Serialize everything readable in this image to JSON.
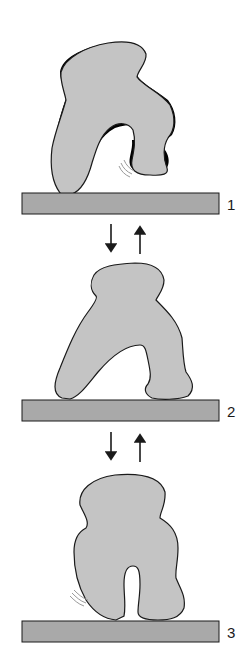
{
  "diagram": {
    "colors": {
      "shape_fill": "#c4c4c4",
      "shape_stroke": "#1a1a1a",
      "bar_fill": "#a9a9a9",
      "bar_stroke": "#1a1a1a",
      "motion_lines": "#9a9a9a",
      "arrow": "#1a1a1a"
    },
    "stages": [
      {
        "label": "1",
        "contacts": 1
      },
      {
        "label": "2",
        "contacts": 2
      },
      {
        "label": "3",
        "contacts": 2
      }
    ],
    "transitions": [
      {
        "from": "1",
        "to": "2",
        "arrows": [
          "down",
          "up"
        ]
      },
      {
        "from": "2",
        "to": "3",
        "arrows": [
          "down",
          "up"
        ]
      }
    ]
  }
}
